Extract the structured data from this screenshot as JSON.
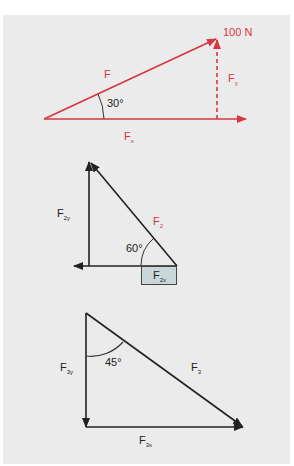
{
  "colors": {
    "background": "#ebebeb",
    "force_red": "#d6363f",
    "vector_dark": "#222222",
    "highlight_box": "#c9d6da"
  },
  "diagram1": {
    "magnitude_label": "100 N",
    "vector_label": "F",
    "angle_label": "30°",
    "x_component": {
      "base": "F",
      "sub": "x"
    },
    "y_component": {
      "base": "F",
      "sub": "y"
    }
  },
  "diagram2": {
    "vector_label": {
      "base": "F",
      "sub": "2"
    },
    "angle_label": "60°",
    "x_component": {
      "base": "F",
      "sub": "2x"
    },
    "y_component": {
      "base": "F",
      "sub": "2y"
    }
  },
  "diagram3": {
    "vector_label": {
      "base": "F",
      "sub": "3"
    },
    "angle_label": "45°",
    "x_component": {
      "base": "F",
      "sub": "3x"
    },
    "y_component": {
      "base": "F",
      "sub": "3y"
    }
  }
}
